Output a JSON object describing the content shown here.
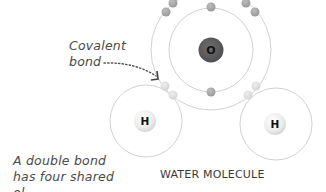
{
  "diagram": {
    "title": "WATER MOLECULE",
    "annotations": {
      "covalent_bond_line1": "Covalent",
      "covalent_bond_line2": "bond",
      "side_note_line1": "A double bond",
      "side_note_line2": "has four shared",
      "side_note_line3": "el"
    },
    "atoms": [
      {
        "id": "oxygen",
        "symbol": "O",
        "color": "#5a5a5a",
        "text_color": "#111111"
      },
      {
        "id": "hydrogen-left",
        "symbol": "H",
        "color": "#f0f0f0",
        "text_color": "#111111"
      },
      {
        "id": "hydrogen-right",
        "symbol": "H",
        "color": "#f0f0f0",
        "text_color": "#111111"
      }
    ],
    "colors": {
      "shell": "#cfcfcf",
      "electron": "#a8a8a8",
      "shared_electron": "#dedede",
      "arrow": "#555555"
    }
  }
}
